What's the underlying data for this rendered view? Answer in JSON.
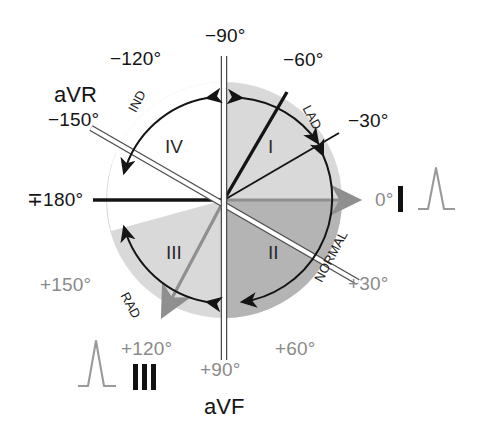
{
  "figure": {
    "type": "hexaxial-reference-diagram",
    "center": {
      "x": 224,
      "y": 200
    },
    "radius": 118
  },
  "colors": {
    "background": "#ffffff",
    "circle_light": "#d8d8d8",
    "quadrant_iv_fill": "#ffffff",
    "quadrant_ii_fill": "#b4b4b4",
    "black": "#141414",
    "gray_text": "#8a8a8a",
    "gray_axis": "#8f8f8f",
    "white_axis": "#ffffff",
    "ecg_trace": "#9a9a9a"
  },
  "degree_labels": [
    {
      "id": "deg-minus-90",
      "text": "−90°",
      "color": "black",
      "x": 205,
      "y": 26,
      "angle": -90
    },
    {
      "id": "deg-minus-120",
      "text": "−120°",
      "color": "black",
      "x": 110,
      "y": 49,
      "angle": -120
    },
    {
      "id": "deg-minus-60",
      "text": "−60°",
      "color": "black",
      "x": 283,
      "y": 50,
      "angle": -60
    },
    {
      "id": "deg-minus-150",
      "text": "−150°",
      "color": "black",
      "x": 48,
      "y": 110,
      "angle": -150
    },
    {
      "id": "deg-minus-30",
      "text": "−30°",
      "color": "black",
      "x": 348,
      "y": 111,
      "angle": -30
    },
    {
      "id": "deg-180",
      "text": "∓180°",
      "color": "black",
      "x": 27,
      "y": 190,
      "angle": 180
    },
    {
      "id": "deg-0",
      "text": "0°",
      "color": "gray",
      "x": 375,
      "y": 190,
      "angle": 0
    },
    {
      "id": "deg-plus-150",
      "text": "+150°",
      "color": "gray",
      "x": 40,
      "y": 275,
      "angle": 150
    },
    {
      "id": "deg-plus-30",
      "text": "+30°",
      "color": "gray",
      "x": 348,
      "y": 274,
      "angle": 30
    },
    {
      "id": "deg-plus-120",
      "text": "+120°",
      "color": "gray",
      "x": 121,
      "y": 339,
      "angle": 120
    },
    {
      "id": "deg-plus-60",
      "text": "+60°",
      "color": "gray",
      "x": 275,
      "y": 339,
      "angle": 60
    },
    {
      "id": "deg-plus-90",
      "text": "+90°",
      "color": "gray",
      "x": 200,
      "y": 360,
      "angle": 90
    }
  ],
  "lead_labels": [
    {
      "id": "lead-avr",
      "text": "aVR",
      "x": 54,
      "y": 84,
      "color": "black"
    },
    {
      "id": "lead-avf",
      "text": "aVF",
      "x": 204,
      "y": 396,
      "color": "black"
    }
  ],
  "quadrant_labels": [
    {
      "id": "quadrant-i",
      "text": "I",
      "x": 268,
      "y": 137,
      "range": "0° to −90°"
    },
    {
      "id": "quadrant-ii",
      "text": "II",
      "x": 268,
      "y": 243,
      "range": "0° to +90°"
    },
    {
      "id": "quadrant-iii",
      "text": "III",
      "x": 166,
      "y": 243,
      "range": "+90° to ±180°"
    },
    {
      "id": "quadrant-iv",
      "text": "IV",
      "x": 165,
      "y": 137,
      "range": "−90° to ±180°"
    }
  ],
  "arc_labels": [
    {
      "id": "arc-label-ind",
      "text": "IND",
      "x": 126,
      "y": 108,
      "rotation": -62,
      "meaning": "indeterminate axis"
    },
    {
      "id": "arc-label-lad",
      "text": "LAD",
      "x": 312,
      "y": 103,
      "rotation": 62,
      "meaning": "left axis deviation"
    },
    {
      "id": "arc-label-rad",
      "text": "RAD",
      "x": 130,
      "y": 290,
      "rotation": 62,
      "meaning": "right axis deviation"
    },
    {
      "id": "arc-label-normal",
      "text": "NORMAL",
      "x": 312,
      "y": 278,
      "rotation": -62,
      "meaning": "normal axis"
    }
  ],
  "lead_strips": [
    {
      "id": "ecg-strip-lead-i",
      "lead": "I",
      "bars": 1,
      "label_x": 398,
      "label_y": 186,
      "trace_x": 418,
      "trace_y": 172
    },
    {
      "id": "ecg-strip-lead-iii",
      "lead": "III",
      "bars": 3,
      "label_x": 133,
      "label_y": 364,
      "trace_x": 78,
      "trace_y": 340
    }
  ],
  "axes": [
    {
      "id": "axis-avf",
      "name": "aVF white axis",
      "style": "white-outlined",
      "from_angle": -90,
      "to_angle": 90
    },
    {
      "id": "axis-avr",
      "name": "aVR white axis",
      "style": "white-outlined",
      "from_angle": -150,
      "to_angle": 30
    },
    {
      "id": "axis-lead-i",
      "name": "Lead I gray arrow",
      "style": "gray-arrow",
      "from_angle": 180,
      "to_angle": 0
    },
    {
      "id": "axis-lead-iii",
      "name": "Lead III gray arrow",
      "style": "gray-arrow",
      "from_angle": -60,
      "to_angle": 120
    },
    {
      "id": "axis-lead-ii",
      "name": "Lead II black ray",
      "style": "black-line",
      "from_angle": 0,
      "to_angle": -60
    },
    {
      "id": "axis-minus30",
      "name": "−30° black ray",
      "style": "black-line",
      "from_angle": 0,
      "to_angle": -30
    },
    {
      "id": "axis-180",
      "name": "±180° black ray",
      "style": "black-line",
      "from_angle": 0,
      "to_angle": 180
    }
  ],
  "arcs": [
    {
      "id": "arc-ind",
      "label": "IND",
      "start_angle": -90,
      "end_angle": -180,
      "arrows": "both"
    },
    {
      "id": "arc-lad",
      "label": "LAD",
      "start_angle": -90,
      "end_angle": -30,
      "arrows": "both"
    },
    {
      "id": "arc-normal",
      "label": "NORMAL",
      "start_angle": -30,
      "end_angle": 90,
      "arrows": "both"
    },
    {
      "id": "arc-rad",
      "label": "RAD",
      "start_angle": 90,
      "end_angle": 180,
      "arrows": "both"
    }
  ]
}
